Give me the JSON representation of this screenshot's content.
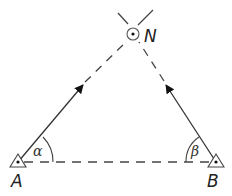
{
  "diagram": {
    "type": "triangulation",
    "points": {
      "A": {
        "label": "A",
        "x": 18,
        "y": 162
      },
      "B": {
        "label": "B",
        "x": 216,
        "y": 162
      },
      "N": {
        "label": "N",
        "x": 133,
        "y": 34
      }
    },
    "angles": {
      "alpha": {
        "label": "α",
        "vertex": "A"
      },
      "beta": {
        "label": "β",
        "vertex": "B"
      }
    },
    "colors": {
      "line": "#333333",
      "dash": "#444444",
      "background": "#ffffff"
    }
  }
}
